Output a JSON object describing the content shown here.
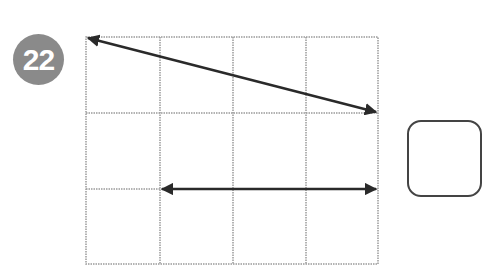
{
  "question": {
    "number": "22",
    "badge_color": "#8a8a8a"
  },
  "grid": {
    "columns": 4,
    "rows": 3,
    "line_color": "#9a9a9a"
  },
  "arrows": [
    {
      "name": "diagonal-arrow",
      "from": [
        0,
        0
      ],
      "to": [
        4,
        1
      ],
      "heads": "both"
    },
    {
      "name": "horizontal-arrow",
      "from": [
        1,
        2
      ],
      "to": [
        4,
        2
      ],
      "heads": "both"
    }
  ],
  "answer_box": {
    "value": ""
  }
}
